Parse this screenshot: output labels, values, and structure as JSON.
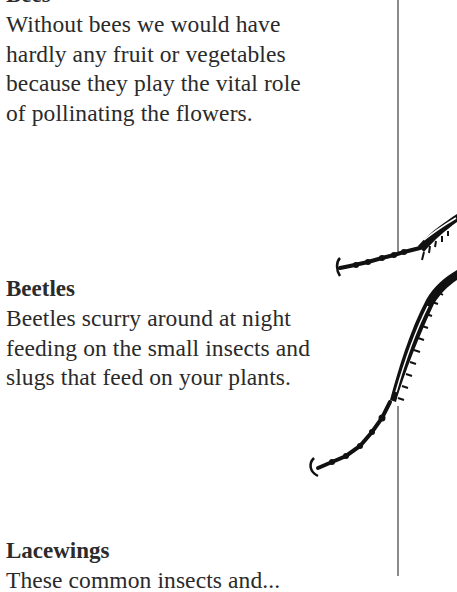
{
  "sections": [
    {
      "heading": "Bees",
      "body_lines": [
        "Without bees we would have",
        "hardly any fruit or vegetables",
        "because they play the vital role",
        "of pollinating the flowers."
      ]
    },
    {
      "heading": "Beetles",
      "body_lines": [
        "Beetles scurry around at night",
        "feeding on the small insects and",
        "slugs that feed on your plants."
      ]
    },
    {
      "heading": "Lacewings",
      "body_lines": [
        "These common insects and..."
      ]
    }
  ],
  "illustration": {
    "icon": "beetle-legs-illustration",
    "color": "#111111"
  },
  "divider": {
    "color": "#8a8a8a"
  }
}
